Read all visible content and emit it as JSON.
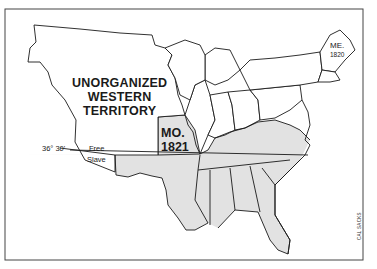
{
  "map": {
    "title": "Missouri Compromise",
    "colors": {
      "slave_fill": "#e2e2e2",
      "free_fill": "#ffffff",
      "border": "#1a1a1a",
      "frame": "#444444"
    },
    "labels": {
      "territory_line1": "UNORGANIZED",
      "territory_line2": "WESTERN",
      "territory_line3": "TERRITORY",
      "missouri": "MO.",
      "missouri_year": "1821",
      "maine": "ME.",
      "maine_year": "1820",
      "latitude": "36° 30'",
      "free": "Free",
      "slave": "Slave"
    },
    "credit": "CAL SACKS"
  }
}
